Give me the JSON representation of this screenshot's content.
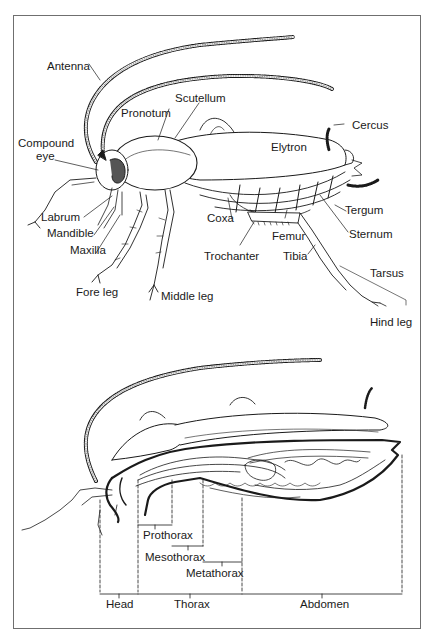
{
  "figure": {
    "colors": {
      "ink": "#1a1a1a",
      "frame": "#6f6f6f",
      "background": "#ffffff"
    },
    "external_view": {
      "labels": [
        {
          "id": "antenna",
          "text": "Antenna"
        },
        {
          "id": "scutellum",
          "text": "Scutellum"
        },
        {
          "id": "pronotum",
          "text": "Pronotum"
        },
        {
          "id": "compound_eye_1",
          "text": "Compound"
        },
        {
          "id": "compound_eye_2",
          "text": "eye"
        },
        {
          "id": "cercus",
          "text": "Cercus"
        },
        {
          "id": "elytron",
          "text": "Elytron"
        },
        {
          "id": "labrum",
          "text": "Labrum"
        },
        {
          "id": "mandible",
          "text": "Mandible"
        },
        {
          "id": "maxilla",
          "text": "Maxilla"
        },
        {
          "id": "coxa",
          "text": "Coxa"
        },
        {
          "id": "tergum",
          "text": "Tergum"
        },
        {
          "id": "sternum",
          "text": "Sternum"
        },
        {
          "id": "femur",
          "text": "Femur"
        },
        {
          "id": "trochanter",
          "text": "Trochanter"
        },
        {
          "id": "tibia",
          "text": "Tibia"
        },
        {
          "id": "tarsus",
          "text": "Tarsus"
        },
        {
          "id": "fore_leg",
          "text": "Fore leg"
        },
        {
          "id": "middle_leg",
          "text": "Middle leg"
        },
        {
          "id": "hind_leg",
          "text": "Hind leg"
        }
      ]
    },
    "segment_view": {
      "labels": [
        {
          "id": "prothorax",
          "text": "Prothorax"
        },
        {
          "id": "mesothorax",
          "text": "Mesothorax"
        },
        {
          "id": "metathorax",
          "text": "Metathorax"
        },
        {
          "id": "head",
          "text": "Head"
        },
        {
          "id": "thorax",
          "text": "Thorax"
        },
        {
          "id": "abdomen",
          "text": "Abdomen"
        }
      ]
    }
  }
}
